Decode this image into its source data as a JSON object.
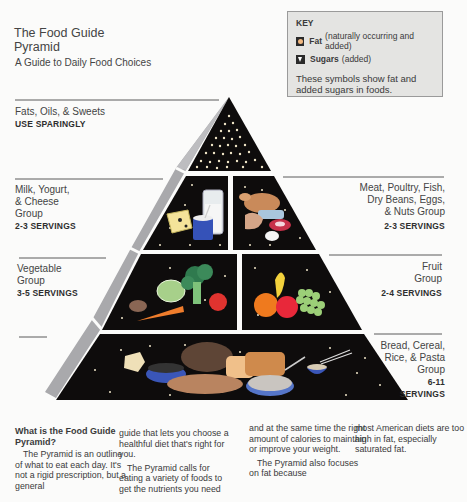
{
  "header": {
    "title_line1": "The Food Guide",
    "title_line2": "Pyramid",
    "subtitle": "A Guide to Daily Food Choices"
  },
  "key": {
    "title": "KEY",
    "items": [
      {
        "icon": "fat-circle-icon",
        "label": "Fat",
        "detail": "(naturally occurring and added)"
      },
      {
        "icon": "sugar-triangle-icon",
        "label": "Sugars",
        "detail": "(added)"
      }
    ],
    "note": "These symbols show fat and added sugars in foods."
  },
  "groups": {
    "fats": {
      "name": "Fats, Oils, & Sweets",
      "servings": "USE SPARINGLY"
    },
    "milk": {
      "name_lines": [
        "Milk, Yogurt,",
        "& Cheese",
        "Group"
      ],
      "servings": "2-3 SERVINGS"
    },
    "meat": {
      "name_lines": [
        "Meat, Poultry, Fish,",
        "Dry Beans, Eggs,",
        "& Nuts Group"
      ],
      "servings": "2-3 SERVINGS"
    },
    "vegetable": {
      "name_lines": [
        "Vegetable",
        "Group"
      ],
      "servings": "3-5 SERVINGS"
    },
    "fruit": {
      "name_lines": [
        "Fruit",
        "Group"
      ],
      "servings": "2-4 SERVINGS"
    },
    "bread": {
      "name_lines": [
        "Bread, Cereal,",
        "Rice, & Pasta",
        "Group"
      ],
      "servings_lines": [
        "6-11",
        "SERVINGS"
      ]
    }
  },
  "article": {
    "heading": "What is the Food Guide Pyramid?",
    "col1": "The Pyramid is an outline of what to eat each day. It's not a rigid prescription, but a general",
    "col2a": "guide that lets you choose a healthful diet that's right for you.",
    "col2b": "The Pyramid  calls for eating a variety of foods to get the nutrients you need",
    "col3a": "and at the same time the right amount of calories to maintain or improve your weight.",
    "col3b": "The Pyramid also focuses on fat because",
    "col4": "most American diets are too high in fat, especially saturated fat."
  },
  "colors": {
    "tier_bg": "#0e0c0c",
    "side_face": "#a7a7aa",
    "dot": "#f0e6c8",
    "rule": "#5a5a5a"
  }
}
